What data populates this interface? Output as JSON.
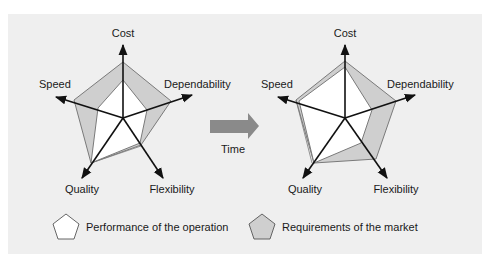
{
  "diagram": {
    "colors": {
      "panel_bg": "#efefef",
      "market_fill": "#cfcfcf",
      "operation_fill": "#ffffff",
      "outline": "#7a7a7a",
      "axis": "#111111",
      "time_arrow": "#8a8a8a"
    },
    "axes": [
      "Cost",
      "Dependability",
      "Flexibility",
      "Quality",
      "Speed"
    ],
    "charts": [
      {
        "name": "before",
        "labels": {
          "cost": "Cost",
          "dependability": "Dependability",
          "flexibility": "Flexibility",
          "quality": "Quality",
          "speed": "Speed"
        }
      },
      {
        "name": "after",
        "labels": {
          "cost": "Cost",
          "dependability": "Dependability",
          "flexibility": "Flexibility",
          "quality": "Quality",
          "speed": "Speed"
        }
      }
    ],
    "time_arrow": {
      "label": "Time"
    },
    "legend": [
      {
        "label": "Performance of the operation",
        "swatch": "white-pentagon"
      },
      {
        "label": "Requirements of the market",
        "swatch": "gray-pentagon"
      }
    ]
  }
}
